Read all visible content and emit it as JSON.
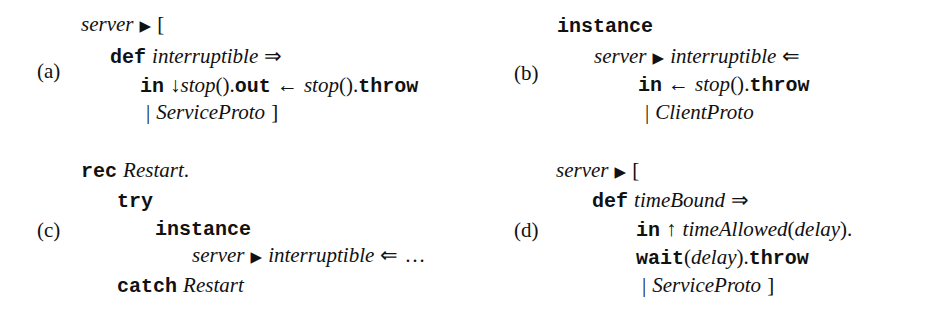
{
  "panels": {
    "a": {
      "label": "(a)",
      "l1": {
        "server": "server",
        "tri": "▶",
        "open": "["
      },
      "l2": {
        "def": "def",
        "name": "interruptible",
        "arrow": "⇒"
      },
      "l3": {
        "in": "in",
        "down": "↓",
        "stop1": "stop",
        "parens1": "()",
        "dot1": ".",
        "out": "out",
        "larrow": "←",
        "stop2": "stop",
        "parens2": "()",
        "dot2": ".",
        "throw": "throw"
      },
      "l4": {
        "bar": "|",
        "proto": "ServiceProto",
        "close": "]"
      }
    },
    "b": {
      "label": "(b)",
      "l1": {
        "instance": "instance"
      },
      "l2": {
        "server": "server",
        "tri": "▶",
        "name": "interruptible",
        "arrow": "⇐"
      },
      "l3": {
        "in": "in",
        "larrow": "←",
        "stop": "stop",
        "parens": "()",
        "dot": ".",
        "throw": "throw"
      },
      "l4": {
        "bar": "|",
        "proto": "ClientProto"
      }
    },
    "c": {
      "label": "(c)",
      "l1": {
        "rec": "rec",
        "name": "Restart",
        "dot": "."
      },
      "l2": {
        "try": "try"
      },
      "l3": {
        "instance": "instance"
      },
      "l4": {
        "server": "server",
        "tri": "▶",
        "name": "interruptible",
        "arrow": "⇐",
        "ellipsis": "…"
      },
      "l5": {
        "catch": "catch",
        "name": "Restart"
      }
    },
    "d": {
      "label": "(d)",
      "l1": {
        "server": "server",
        "tri": "▶",
        "open": "["
      },
      "l2": {
        "def": "def",
        "name": "timeBound",
        "arrow": "⇒"
      },
      "l3": {
        "in": "in",
        "up": "↑",
        "fn": "timeAllowed",
        "lp": "(",
        "arg": "delay",
        "rp": ")",
        "dot": "."
      },
      "l4": {
        "wait": "wait",
        "lp": "(",
        "arg": "delay",
        "rp": ")",
        "dot": ".",
        "throw": "throw"
      },
      "l5": {
        "bar": "|",
        "proto": "ServiceProto",
        "close": "]"
      }
    }
  }
}
